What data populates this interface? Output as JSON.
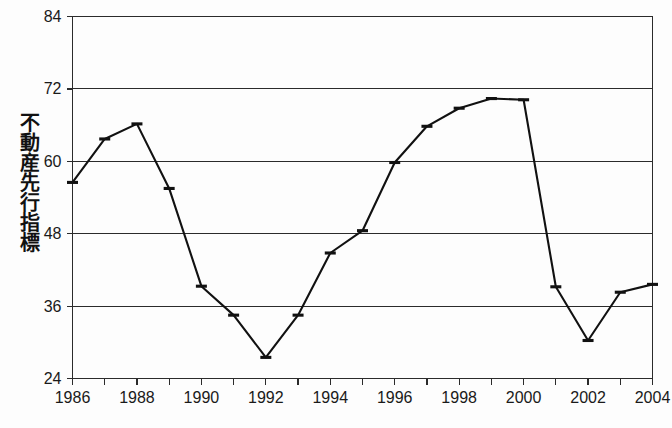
{
  "chart_data": {
    "type": "line",
    "title": "",
    "xlabel": "",
    "ylabel": "不動産先行指標",
    "x": [
      1986,
      1987,
      1988,
      1989,
      1990,
      1991,
      1992,
      1993,
      1994,
      1995,
      1996,
      1997,
      1998,
      1999,
      2000,
      2001,
      2002,
      2003,
      2004
    ],
    "values": [
      56.5,
      63.7,
      66.2,
      55.5,
      39.3,
      34.5,
      27.5,
      34.5,
      44.8,
      48.5,
      59.8,
      65.8,
      68.8,
      70.4,
      70.2,
      39.2,
      30.3,
      38.3,
      39.6
    ],
    "xlim": [
      1986,
      2004
    ],
    "ylim": [
      24,
      84
    ],
    "yticks": [
      24,
      36,
      48,
      60,
      72,
      84
    ],
    "ytick_labels": [
      "24",
      "36",
      "48",
      "60",
      "72",
      "84"
    ],
    "xticks": [
      1986,
      1987,
      1988,
      1989,
      1990,
      1991,
      1992,
      1993,
      1994,
      1995,
      1996,
      1997,
      1998,
      1999,
      2000,
      2001,
      2002,
      2003,
      2004
    ],
    "xtick_labels": [
      "1986",
      "",
      "1988",
      "",
      "1990",
      "",
      "1992",
      "",
      "1994",
      "",
      "1996",
      "",
      "1998",
      "",
      "2000",
      "",
      "2002",
      "",
      "2004"
    ],
    "grid": "horizontal",
    "legend": "none",
    "series_name": "不動産先行指標",
    "line_color": "#111111",
    "marker_style": "horizontal-bar"
  },
  "axis": {
    "y_title": "不動産先行指標"
  }
}
